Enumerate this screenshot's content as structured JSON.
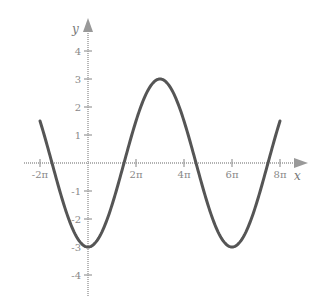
{
  "chart_data": {
    "type": "line",
    "title": "",
    "xlabel": "x",
    "ylabel": "y",
    "function": "y = -3cos(x/3)",
    "x_tick_labels": [
      "-2π",
      "2π",
      "4π",
      "6π",
      "8π"
    ],
    "x_ticks": [
      -6.2832,
      6.2832,
      12.5664,
      18.8496,
      25.1327
    ],
    "y_tick_labels": [
      "4",
      "3",
      "2",
      "1",
      "-1",
      "-2",
      "-3",
      "-4"
    ],
    "y_ticks": [
      4,
      3,
      2,
      1,
      -1,
      -2,
      -3,
      -4
    ],
    "xlim": [
      -8.0,
      30.5
    ],
    "ylim": [
      -4.8,
      5.0
    ],
    "grid": false,
    "legend": null,
    "series": [
      {
        "name": "curve",
        "x_pi_units": [
          -2,
          -1.5,
          -1,
          -0.5,
          0,
          0.5,
          1,
          1.5,
          2,
          2.5,
          3,
          3.5,
          4,
          4.5,
          5,
          5.5,
          6,
          6.5,
          7,
          7.5,
          8
        ],
        "values": [
          1.5,
          0.0,
          -1.5,
          -2.6,
          -3.0,
          -2.6,
          -1.5,
          0.0,
          1.5,
          2.6,
          3.0,
          2.6,
          1.5,
          0.0,
          -1.5,
          -2.6,
          -3.0,
          -2.6,
          -1.5,
          0.0,
          1.5
        ],
        "color": "#555555"
      }
    ],
    "key_points": {
      "maximum": {
        "x": "3π",
        "y": 3
      },
      "minima": [
        {
          "x": "0",
          "y": -3
        },
        {
          "x": "6π",
          "y": -3
        }
      ],
      "endpoints": [
        {
          "x": "-2π",
          "y": 1.5
        },
        {
          "x": "8π",
          "y": 1.5
        }
      ]
    }
  },
  "axes": {
    "x_name": "x",
    "y_name": "y"
  }
}
